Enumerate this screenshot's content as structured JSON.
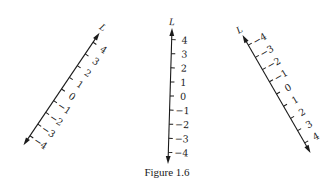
{
  "figure": {
    "caption": "Figure 1.6",
    "axis_name": "L",
    "tick_spacing": 14.1,
    "half_length": 68,
    "lines": [
      {
        "id": "left-line",
        "center": [
          61.5,
          89
        ],
        "rotation_deg": 34,
        "ticks": [
          {
            "value": -4,
            "label": "−4"
          },
          {
            "value": -3,
            "label": "−3"
          },
          {
            "value": -2,
            "label": "−2"
          },
          {
            "value": -1,
            "label": "−1"
          },
          {
            "value": 0,
            "label": "0"
          },
          {
            "value": 1,
            "label": "1"
          },
          {
            "value": 2,
            "label": "2"
          },
          {
            "value": 3,
            "label": "3"
          },
          {
            "value": 4,
            "label": "4"
          }
        ]
      },
      {
        "id": "middle-line",
        "center": [
          170,
          96
        ],
        "rotation_deg": 1.7,
        "ticks": [
          {
            "value": -4,
            "label": "−4"
          },
          {
            "value": -3,
            "label": "−3"
          },
          {
            "value": -2,
            "label": "−2"
          },
          {
            "value": -1,
            "label": "−1"
          },
          {
            "value": 0,
            "label": "0"
          },
          {
            "value": 1,
            "label": "1"
          },
          {
            "value": 2,
            "label": "2"
          },
          {
            "value": 3,
            "label": "3"
          },
          {
            "value": 4,
            "label": "4"
          }
        ]
      },
      {
        "id": "right-line",
        "center": [
          276.5,
          94
        ],
        "rotation_deg": -30,
        "ticks": [
          {
            "value": -4,
            "label": "−4"
          },
          {
            "value": -3,
            "label": "−3"
          },
          {
            "value": -2,
            "label": "−2"
          },
          {
            "value": -1,
            "label": "−1"
          },
          {
            "value": 0,
            "label": "0"
          },
          {
            "value": 1,
            "label": "1"
          },
          {
            "value": 2,
            "label": "2"
          },
          {
            "value": 3,
            "label": "3"
          },
          {
            "value": 4,
            "label": "4"
          }
        ],
        "reversed": true
      }
    ]
  }
}
